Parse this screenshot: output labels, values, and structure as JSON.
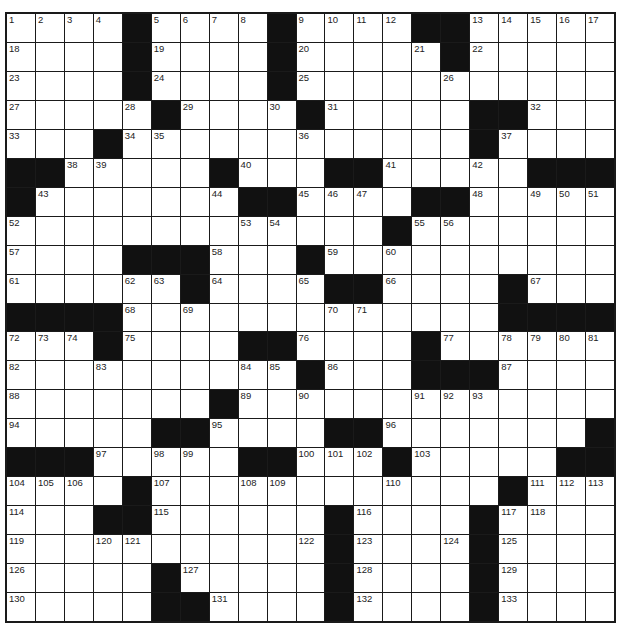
{
  "puzzle": {
    "rows": 21,
    "cols": 21,
    "grid": [
      [
        "1",
        "2",
        "3",
        "4",
        "#",
        "5",
        "6",
        "7",
        "8",
        "#",
        "9",
        "10",
        "11",
        "12",
        "#",
        "#",
        "13",
        "14",
        "15",
        "16",
        "17"
      ],
      [
        "18",
        ".",
        ".",
        ".",
        "#",
        "19",
        ".",
        ".",
        ".",
        "#",
        "20",
        ".",
        ".",
        ".",
        "21",
        "#",
        "22",
        ".",
        ".",
        ".",
        "."
      ],
      [
        "23",
        ".",
        ".",
        ".",
        "#",
        "24",
        ".",
        ".",
        ".",
        "#",
        "25",
        ".",
        ".",
        ".",
        ".",
        "26",
        ".",
        ".",
        ".",
        ".",
        "."
      ],
      [
        "27",
        ".",
        ".",
        ".",
        "28",
        "#",
        "29",
        ".",
        ".",
        "30",
        "#",
        "31",
        ".",
        ".",
        ".",
        ".",
        "#",
        "#",
        "32",
        ".",
        "."
      ],
      [
        "33",
        ".",
        ".",
        "#",
        "34",
        "35",
        ".",
        ".",
        ".",
        ".",
        "36",
        ".",
        ".",
        ".",
        ".",
        ".",
        "#",
        "37",
        ".",
        ".",
        "."
      ],
      [
        "#",
        "#",
        "38",
        "39",
        ".",
        ".",
        ".",
        "#",
        "40",
        ".",
        ".",
        "#",
        "#",
        "41",
        ".",
        ".",
        "42",
        ".",
        "#",
        "#",
        "#"
      ],
      [
        "#",
        "43",
        ".",
        ".",
        ".",
        ".",
        ".",
        "44",
        "#",
        "#",
        "45",
        "46",
        "47",
        ".",
        "#",
        "#",
        "48",
        ".",
        "49",
        "50",
        "51"
      ],
      [
        "52",
        ".",
        ".",
        ".",
        ".",
        ".",
        ".",
        ".",
        "53",
        "54",
        ".",
        ".",
        ".",
        "#",
        "55",
        "56",
        ".",
        ".",
        ".",
        ".",
        "."
      ],
      [
        "57",
        ".",
        ".",
        ".",
        "#",
        "#",
        "#",
        "58",
        ".",
        ".",
        "#",
        "59",
        ".",
        "60",
        ".",
        ".",
        ".",
        ".",
        ".",
        ".",
        "."
      ],
      [
        "61",
        ".",
        ".",
        ".",
        "62",
        "63",
        "#",
        "64",
        ".",
        ".",
        "65",
        "#",
        "#",
        "66",
        ".",
        ".",
        ".",
        "#",
        "67",
        ".",
        "."
      ],
      [
        "#",
        "#",
        "#",
        "#",
        "68",
        ".",
        "69",
        ".",
        ".",
        ".",
        ".",
        "70",
        "71",
        ".",
        ".",
        ".",
        ".",
        "#",
        "#",
        "#",
        "#"
      ],
      [
        "72",
        "73",
        "74",
        "#",
        "75",
        ".",
        ".",
        ".",
        "#",
        "#",
        "76",
        ".",
        ".",
        ".",
        "#",
        "77",
        ".",
        "78",
        "79",
        "80",
        "81"
      ],
      [
        "82",
        ".",
        ".",
        "83",
        ".",
        ".",
        ".",
        ".",
        "84",
        "85",
        "#",
        "86",
        ".",
        ".",
        "#",
        "#",
        "#",
        "87",
        ".",
        ".",
        "."
      ],
      [
        "88",
        ".",
        ".",
        ".",
        ".",
        ".",
        ".",
        "#",
        "89",
        ".",
        "90",
        ".",
        ".",
        ".",
        "91",
        "92",
        "93",
        ".",
        ".",
        ".",
        "."
      ],
      [
        "94",
        ".",
        ".",
        ".",
        ".",
        "#",
        "#",
        "95",
        ".",
        ".",
        ".",
        "#",
        "#",
        "96",
        ".",
        ".",
        ".",
        ".",
        ".",
        ".",
        "#"
      ],
      [
        "#",
        "#",
        "#",
        "97",
        ".",
        "98",
        "99",
        ".",
        "#",
        "#",
        "100",
        "101",
        "102",
        "#",
        "103",
        ".",
        ".",
        ".",
        ".",
        "#",
        "#"
      ],
      [
        "104",
        "105",
        "106",
        ".",
        "#",
        "107",
        ".",
        ".",
        "108",
        "109",
        ".",
        ".",
        ".",
        "110",
        ".",
        ".",
        ".",
        "#",
        "111",
        "112",
        "113"
      ],
      [
        "114",
        ".",
        ".",
        "#",
        "#",
        "115",
        ".",
        ".",
        ".",
        ".",
        ".",
        "#",
        "116",
        ".",
        ".",
        ".",
        "#",
        "117",
        "118",
        ".",
        "."
      ],
      [
        "119",
        ".",
        ".",
        "120",
        "121",
        ".",
        ".",
        ".",
        ".",
        ".",
        "122",
        "#",
        "123",
        ".",
        ".",
        "124",
        "#",
        "125",
        ".",
        ".",
        "."
      ],
      [
        "126",
        ".",
        ".",
        ".",
        ".",
        "#",
        "127",
        ".",
        ".",
        ".",
        ".",
        "#",
        "128",
        ".",
        ".",
        ".",
        "#",
        "129",
        ".",
        ".",
        "."
      ],
      [
        "130",
        ".",
        ".",
        ".",
        ".",
        "#",
        "#",
        "131",
        ".",
        ".",
        ".",
        "#",
        "132",
        ".",
        ".",
        ".",
        "#",
        "133",
        ".",
        ".",
        "."
      ]
    ]
  },
  "colors": {
    "block": "#111111",
    "cell": "#ffffff",
    "line": "#1a1a1a",
    "number": "#222222"
  }
}
